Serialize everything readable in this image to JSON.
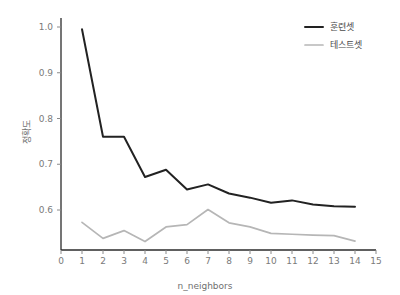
{
  "chart_data": {
    "type": "line",
    "title": "",
    "xlabel": "n_neighbors",
    "ylabel": "정확도",
    "x": [
      1,
      2,
      3,
      4,
      5,
      6,
      7,
      8,
      9,
      10,
      11,
      12,
      13,
      14
    ],
    "xlim": [
      0,
      15
    ],
    "ylim": [
      0.52,
      1.02
    ],
    "xticks": [
      0,
      1,
      2,
      3,
      4,
      5,
      6,
      7,
      8,
      9,
      10,
      11,
      12,
      13,
      14,
      15
    ],
    "xticklabels": [
      "0",
      "1",
      "2",
      "3",
      "4",
      "5",
      "6",
      "7",
      "8",
      "9",
      "10",
      "11",
      "12",
      "13",
      "14",
      "15"
    ],
    "yticks": [
      0.6,
      0.7,
      0.8,
      0.9,
      1.0
    ],
    "yticklabels": [
      "0.6",
      "0.7",
      "0.8",
      "0.9",
      "1.0"
    ],
    "grid": false,
    "legend_position": "upper right",
    "series": [
      {
        "name": "훈련셋",
        "color": "#222222",
        "width": 2.0,
        "values": [
          0.995,
          0.76,
          0.76,
          0.672,
          0.688,
          0.645,
          0.656,
          0.636,
          0.627,
          0.616,
          0.621,
          0.612,
          0.608,
          0.607
        ]
      },
      {
        "name": "테스트셋",
        "color": "#b6b6b6",
        "width": 1.7,
        "values": [
          0.573,
          0.538,
          0.555,
          0.531,
          0.563,
          0.568,
          0.601,
          0.572,
          0.563,
          0.549,
          0.547,
          0.545,
          0.544,
          0.532
        ]
      }
    ]
  },
  "axes": {
    "x_axis_title": "n_neighbors",
    "y_axis_title": "정확도"
  },
  "legend": {
    "entries": [
      {
        "label": "훈련셋"
      },
      {
        "label": "테스트셋"
      }
    ]
  }
}
